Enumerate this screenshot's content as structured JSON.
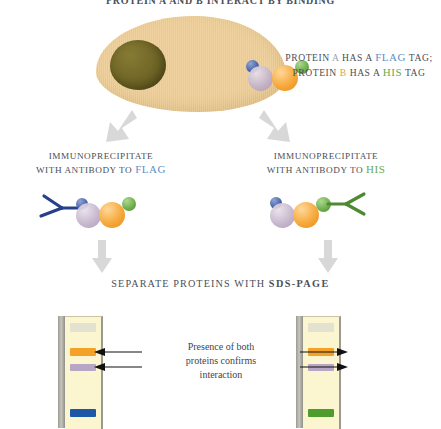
{
  "title": "PROTEIN A AND B INTERACT BY BINDING",
  "cell": {
    "label": "cell-diagram",
    "nucleus_label": "nucleus",
    "colors": {
      "cytoplasm": "#ecca8d",
      "nucleus": "#6f6526"
    }
  },
  "proteins": {
    "a_label": "A",
    "b_label": "B",
    "flag_tag": "FLAG",
    "his_tag": "HIS",
    "colors": {
      "blue_tag": "#4a63a8",
      "protein_a": "#c3b3cb",
      "protein_b": "#f6a93c",
      "green_tag": "#6fae4c"
    }
  },
  "legend": {
    "line1_pre": "PROTEIN ",
    "line1_a": "A",
    "line1_mid": " HAS A ",
    "line1_flag": "FLAG",
    "line1_post": " TAG;",
    "line2_pre": "PROTEIN ",
    "line2_b": "B",
    "line2_mid": " HAS A ",
    "line2_his": "HIS",
    "line2_post": " TAG"
  },
  "steps": {
    "left": {
      "line1": "IMMUNOPRECIPITATE",
      "line2_pre": "WITH ANTIBODY TO ",
      "line2_tag": "FLAG",
      "antibody_color": "#27408b"
    },
    "right": {
      "line1": "IMMUNOPRECIPITATE",
      "line2_pre": "WITH ANTIBODY TO ",
      "line2_tag": "HIS",
      "antibody_color": "#4e8a32"
    }
  },
  "sds": {
    "pre": "SEPARATE PROTEINS WITH ",
    "strong": "SDS-PAGE"
  },
  "gels": {
    "left": {
      "name": "gel-lane-flag",
      "bands": [
        {
          "name": "well-band",
          "color": "#e3e1cf",
          "label": "well"
        },
        {
          "name": "protein-b-band",
          "color": "#f4a128",
          "label": "protein B"
        },
        {
          "name": "protein-a-band",
          "color": "#b9a5c4",
          "label": "protein A"
        },
        {
          "name": "flag-antibody-band",
          "color": "#1f57a8",
          "label": "anti-FLAG antibody"
        }
      ]
    },
    "right": {
      "name": "gel-lane-his",
      "bands": [
        {
          "name": "well-band",
          "color": "#e3e1cf",
          "label": "well"
        },
        {
          "name": "protein-b-band",
          "color": "#f4a128",
          "label": "protein B"
        },
        {
          "name": "protein-a-band",
          "color": "#b9a5c4",
          "label": "protein A"
        },
        {
          "name": "his-antibody-band",
          "color": "#4e9c2d",
          "label": "anti-HIS antibody"
        }
      ]
    }
  },
  "annotation": {
    "line1": "Presence of both",
    "line2": "proteins confirms",
    "line3": "interaction"
  },
  "arrows": {
    "color": "#d5d5d5",
    "annotation_arrow_color": "#111111"
  }
}
